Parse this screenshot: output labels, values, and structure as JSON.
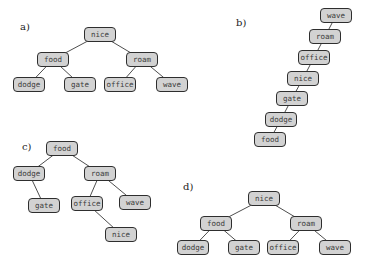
{
  "panels": [
    {
      "label": "a)",
      "label_pos": [
        20,
        21
      ],
      "nodes": [
        {
          "id": "nice",
          "text": "nice",
          "x": 84,
          "y": 27
        },
        {
          "id": "food",
          "text": "food",
          "x": 37,
          "y": 52
        },
        {
          "id": "roam",
          "text": "roam",
          "x": 126,
          "y": 52
        },
        {
          "id": "dodge",
          "text": "dodge",
          "x": 13,
          "y": 77
        },
        {
          "id": "gate",
          "text": "gate",
          "x": 64,
          "y": 77
        },
        {
          "id": "office",
          "text": "office",
          "x": 104,
          "y": 77
        },
        {
          "id": "wave",
          "text": "wave",
          "x": 156,
          "y": 77
        }
      ],
      "edges": [
        [
          "nice",
          "food"
        ],
        [
          "nice",
          "roam"
        ],
        [
          "food",
          "dodge"
        ],
        [
          "food",
          "gate"
        ],
        [
          "roam",
          "office"
        ],
        [
          "roam",
          "wave"
        ]
      ]
    },
    {
      "label": "b)",
      "label_pos": [
        236,
        17
      ],
      "nodes": [
        {
          "id": "wave",
          "text": "wave",
          "x": 320,
          "y": 8
        },
        {
          "id": "roam",
          "text": "roam",
          "x": 309,
          "y": 29
        },
        {
          "id": "office",
          "text": "office",
          "x": 298,
          "y": 50
        },
        {
          "id": "nice",
          "text": "nice",
          "x": 287,
          "y": 71
        },
        {
          "id": "gate",
          "text": "gate",
          "x": 276,
          "y": 91
        },
        {
          "id": "dodge",
          "text": "dodge",
          "x": 265,
          "y": 112
        },
        {
          "id": "food",
          "text": "food",
          "x": 254,
          "y": 132
        }
      ],
      "edges": [
        [
          "wave",
          "roam"
        ],
        [
          "roam",
          "office"
        ],
        [
          "office",
          "nice"
        ],
        [
          "nice",
          "gate"
        ],
        [
          "gate",
          "dodge"
        ],
        [
          "dodge",
          "food"
        ]
      ]
    },
    {
      "label": "c)",
      "label_pos": [
        22,
        141
      ],
      "nodes": [
        {
          "id": "food",
          "text": "food",
          "x": 46,
          "y": 141
        },
        {
          "id": "dodge",
          "text": "dodge",
          "x": 13,
          "y": 166
        },
        {
          "id": "roam",
          "text": "roam",
          "x": 84,
          "y": 166
        },
        {
          "id": "gate",
          "text": "gate",
          "x": 28,
          "y": 198
        },
        {
          "id": "office",
          "text": "office",
          "x": 71,
          "y": 196
        },
        {
          "id": "wave",
          "text": "wave",
          "x": 119,
          "y": 195
        },
        {
          "id": "nice",
          "text": "nice",
          "x": 105,
          "y": 227
        }
      ],
      "edges": [
        [
          "food",
          "dodge"
        ],
        [
          "food",
          "roam"
        ],
        [
          "dodge",
          "gate"
        ],
        [
          "roam",
          "office"
        ],
        [
          "roam",
          "wave"
        ],
        [
          "office",
          "nice"
        ]
      ]
    },
    {
      "label": "d)",
      "label_pos": [
        183,
        181
      ],
      "nodes": [
        {
          "id": "nice",
          "text": "nice",
          "x": 248,
          "y": 191
        },
        {
          "id": "food",
          "text": "food",
          "x": 200,
          "y": 216
        },
        {
          "id": "roam",
          "text": "roam",
          "x": 290,
          "y": 216
        },
        {
          "id": "dodge",
          "text": "dodge",
          "x": 177,
          "y": 240
        },
        {
          "id": "gate",
          "text": "gate",
          "x": 228,
          "y": 240
        },
        {
          "id": "office",
          "text": "office",
          "x": 267,
          "y": 240
        },
        {
          "id": "wave",
          "text": "wave",
          "x": 319,
          "y": 240
        }
      ],
      "edges": [
        [
          "nice",
          "food"
        ],
        [
          "nice",
          "roam"
        ],
        [
          "food",
          "dodge"
        ],
        [
          "food",
          "gate"
        ],
        [
          "roam",
          "office"
        ],
        [
          "roam",
          "wave"
        ]
      ]
    }
  ],
  "style": {
    "node_fill": "#d2d2d2",
    "node_border": "#2e2e2e",
    "edge_color": "#3a3a3a",
    "node_width": 32,
    "node_height": 15
  }
}
